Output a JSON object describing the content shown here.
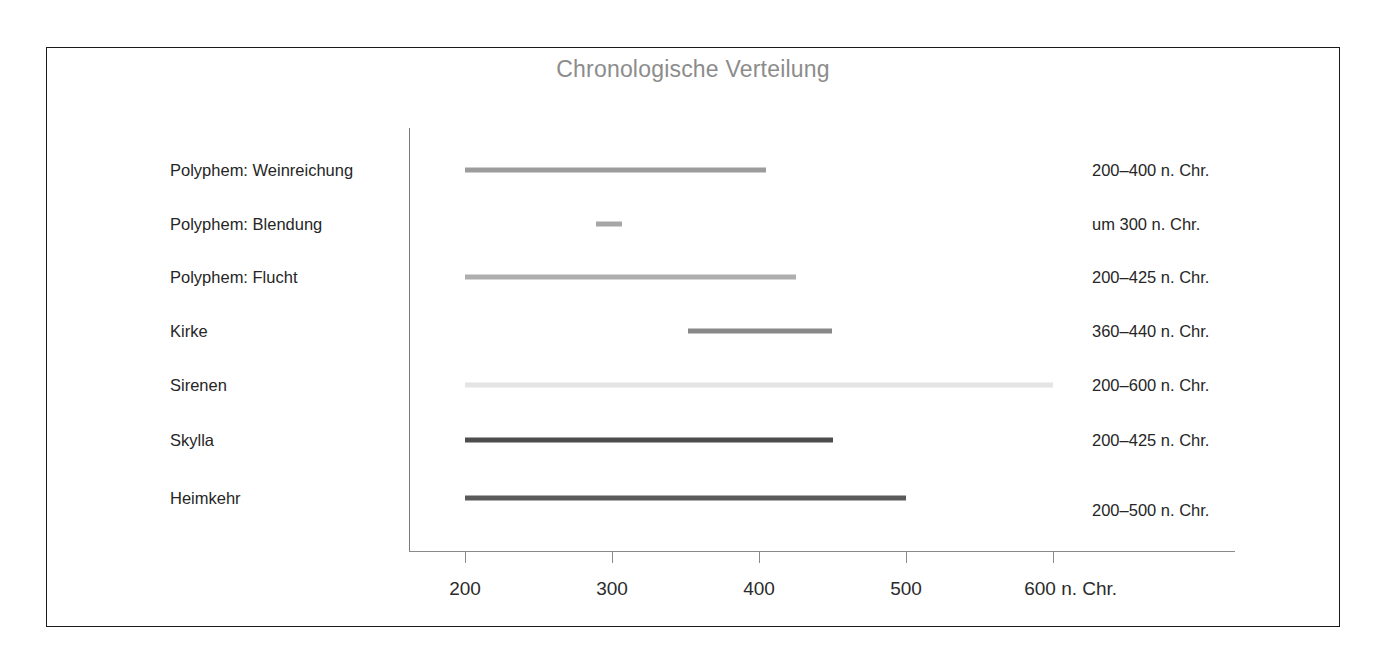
{
  "figure": {
    "title": "Chronologische Verteilung",
    "title_color": "#8c8c8c",
    "frame_color": "#1b1b1b",
    "axis_color": "#8a8a8a",
    "background": "#ffffff"
  },
  "axis": {
    "unit_suffix": "n. Chr.",
    "ticks": [
      {
        "value": 200,
        "label": "200"
      },
      {
        "value": 300,
        "label": "300"
      },
      {
        "value": 400,
        "label": "400"
      },
      {
        "value": 500,
        "label": "500"
      },
      {
        "value": 600,
        "label": "600 n. Chr."
      }
    ],
    "xmin": 200,
    "xmax": 600
  },
  "chart_data": {
    "type": "bar",
    "orientation": "horizontal",
    "subtype": "range-bar / gantt",
    "title": "Chronologische Verteilung",
    "xlabel": "n. Chr.",
    "ylabel": "",
    "xlim": [
      200,
      600
    ],
    "grid": false,
    "legend": false,
    "tick_labels": [
      "200",
      "300",
      "400",
      "500",
      "600 n. Chr."
    ],
    "tick_values": [
      200,
      300,
      400,
      500,
      600
    ],
    "categories": [
      "Polyphem: Weinreichung",
      "Polyphem: Blendung",
      "Polyphem: Flucht",
      "Kirke",
      "Sirenen",
      "Skylla",
      "Heimkehr"
    ],
    "bars": [
      {
        "category": "Polyphem: Weinreichung",
        "start": 200,
        "end": 405,
        "annotation": "200–400 n. Chr.",
        "color": "#9c9c9c"
      },
      {
        "category": "Polyphem: Blendung",
        "start": 289,
        "end": 307,
        "annotation": "um 300 n. Chr.",
        "color": "#a6a6a6"
      },
      {
        "category": "Polyphem: Flucht",
        "start": 200,
        "end": 425,
        "annotation": "200–425 n. Chr.",
        "color": "#aeaeae"
      },
      {
        "category": "Kirke",
        "start": 352,
        "end": 450,
        "annotation": "360–440 n. Chr.",
        "color": "#888888"
      },
      {
        "category": "Sirenen",
        "start": 200,
        "end": 600,
        "annotation": "200–600 n. Chr.",
        "color": "#e4e4e4"
      },
      {
        "category": "Skylla",
        "start": 200,
        "end": 450,
        "annotation": "200–425 n. Chr.",
        "color": "#4d4d4d"
      },
      {
        "category": "Heimkehr",
        "start": 200,
        "end": 500,
        "annotation": "200–500 n. Chr.",
        "color": "#5a5a5a"
      }
    ]
  }
}
